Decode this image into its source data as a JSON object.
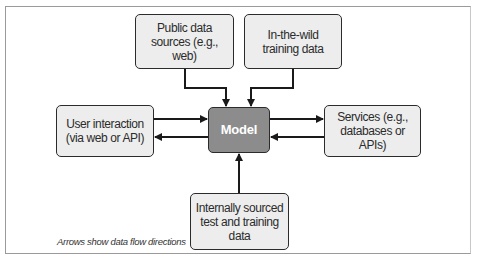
{
  "diagram": {
    "nodes": {
      "public_data": {
        "label": "Public data sources (e.g., web)"
      },
      "wild_data": {
        "label": "In-the-wild training data"
      },
      "user": {
        "label": "User interaction (via web or API)"
      },
      "model": {
        "label": "Model"
      },
      "services": {
        "label": "Services (e.g., databases or APIs)"
      },
      "internal": {
        "label": "Internally sourced test and training data"
      }
    },
    "edges": [
      {
        "from": "public_data",
        "to": "model"
      },
      {
        "from": "wild_data",
        "to": "model"
      },
      {
        "from": "user",
        "to": "model"
      },
      {
        "from": "model",
        "to": "user"
      },
      {
        "from": "model",
        "to": "services"
      },
      {
        "from": "services",
        "to": "model"
      },
      {
        "from": "internal",
        "to": "model"
      }
    ],
    "caption": "Arrows show data flow directions",
    "colors": {
      "box_fill": "#ededed",
      "model_fill": "#8c8c8c",
      "stroke": "#2b2b2b"
    }
  }
}
